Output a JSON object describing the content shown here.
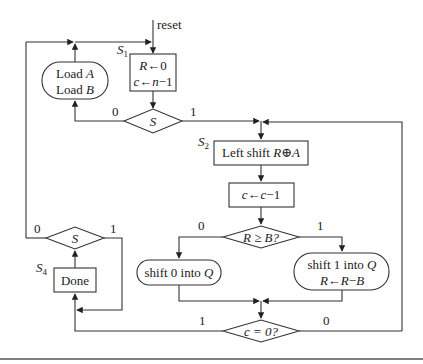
{
  "diagram": {
    "reset_label": "reset",
    "states": {
      "s1": {
        "label": "S",
        "sub": "1",
        "line1_var": "R",
        "line1_rest": "←0",
        "line2_var": "c",
        "line2_mid": "←",
        "line2_var2": "n",
        "line2_rest": "−1"
      },
      "s2": {
        "label": "S",
        "sub": "2",
        "text_prefix": "Left shift ",
        "text_var": "R",
        "text_op": "⊕",
        "text_var2": "A"
      },
      "s4": {
        "label": "S",
        "sub": "4",
        "text": "Done"
      }
    },
    "load_box": {
      "line1_prefix": "Load ",
      "line1_var": "A",
      "line2_prefix": "Load ",
      "line2_var": "B"
    },
    "decrement_box": {
      "var": "c",
      "arrow": "←",
      "var2": "c",
      "rest": "−1"
    },
    "shift0_box": {
      "prefix": "shift 0 into ",
      "var": "Q"
    },
    "shift1_box": {
      "prefix": "shift 1 into ",
      "var": "Q",
      "line2_var": "R",
      "line2_mid": "←",
      "line2_var2": "R",
      "line2_op": "−",
      "line2_var3": "B"
    },
    "decisions": {
      "start_s": {
        "text": "S",
        "branch0": "0",
        "branch1": "1"
      },
      "r_ge_b": {
        "text": "R ≥ B?",
        "branch0": "0",
        "branch1": "1"
      },
      "c_eq_0": {
        "text": "c = 0?",
        "branch1": "1",
        "branch0": "0"
      },
      "done_s": {
        "text": "S",
        "branch0": "0",
        "branch1": "1"
      }
    }
  }
}
